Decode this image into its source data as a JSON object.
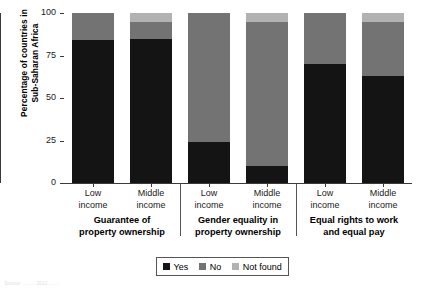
{
  "chart_data": {
    "type": "bar",
    "subtype": "stacked-100-percent",
    "title": "",
    "xlabel": "",
    "ylabel": "Percentage of countries in\nSub-Saharan Africa",
    "ylim": [
      0,
      100
    ],
    "yticks": [
      0,
      25,
      50,
      75,
      100
    ],
    "ytick_labels": [
      "0",
      "25",
      "50",
      "75",
      "100"
    ],
    "grid": false,
    "legend_position": "bottom-center",
    "categories": [
      "Low\nincome",
      "Middle\nincome",
      "Low\nincome",
      "Middle\nincome",
      "Low\nincome",
      "Middle\nincome"
    ],
    "groups": [
      {
        "label": "Guarantee of\nproperty ownership",
        "bars": [
          {
            "category": "Low\nincome",
            "Yes": 84,
            "No": 16,
            "Not found": 0
          },
          {
            "category": "Middle\nincome",
            "Yes": 85,
            "No": 10,
            "Not found": 5
          }
        ]
      },
      {
        "label": "Gender equality in\nproperty ownership",
        "bars": [
          {
            "category": "Low\nincome",
            "Yes": 24,
            "No": 76,
            "Not found": 0
          },
          {
            "category": "Middle\nincome",
            "Yes": 10,
            "No": 85,
            "Not found": 5
          }
        ]
      },
      {
        "label": "Equal rights to work\nand equal pay",
        "bars": [
          {
            "category": "Low\nincome",
            "Yes": 70,
            "No": 30,
            "Not found": 0
          },
          {
            "category": "Middle\nincome",
            "Yes": 63,
            "No": 32,
            "Not found": 5
          }
        ]
      }
    ],
    "series": [
      {
        "name": "Yes",
        "color": "#141414",
        "values": [
          84,
          85,
          24,
          10,
          70,
          63
        ]
      },
      {
        "name": "No",
        "color": "#737373",
        "values": [
          16,
          10,
          76,
          85,
          30,
          32
        ]
      },
      {
        "name": "Not found",
        "color": "#b2b2b2",
        "values": [
          0,
          5,
          0,
          5,
          0,
          5
        ]
      }
    ]
  },
  "legend": {
    "items": [
      {
        "label": "Yes",
        "color": "#141414"
      },
      {
        "label": "No",
        "color": "#737373"
      },
      {
        "label": "Not found",
        "color": "#b2b2b2"
      }
    ]
  },
  "footer": {
    "source_note": "Source: ......... 2012, ......"
  }
}
